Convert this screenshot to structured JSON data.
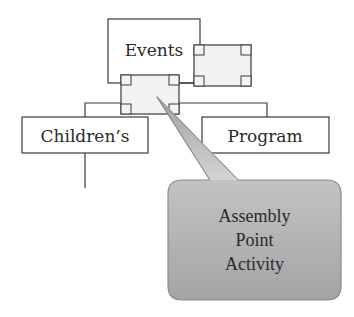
{
  "diagram": {
    "type": "org-chart-with-callout",
    "nodes": {
      "root": {
        "label": "Events"
      },
      "selected_node": {
        "label": "",
        "state": "selected"
      },
      "side_node": {
        "label": "",
        "state": "selected"
      },
      "left_child": {
        "label": "Children’s"
      },
      "right_child": {
        "label": "Program"
      }
    },
    "callout": {
      "lines": [
        "Assembly",
        "Point",
        "Activity"
      ],
      "points_to": "selected_node"
    },
    "colors": {
      "stroke": "#3a3a3a",
      "box_fill": "#ffffff",
      "selected_fill": "#f0f0f0",
      "callout_top": "#d6d6d6",
      "callout_bottom": "#a6a6a6"
    }
  }
}
